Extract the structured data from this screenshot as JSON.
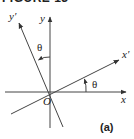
{
  "figure": {
    "title": "FIGURE 13",
    "panel_label": "(a)",
    "axes": {
      "x_label": "x",
      "y_label": "y",
      "x_prime_label": "x′",
      "y_prime_label": "y′",
      "origin_label": "O"
    },
    "angles": {
      "theta_x": "θ",
      "theta_y": "θ"
    },
    "colors": {
      "line": "#333333",
      "background": "#ffffff"
    }
  }
}
